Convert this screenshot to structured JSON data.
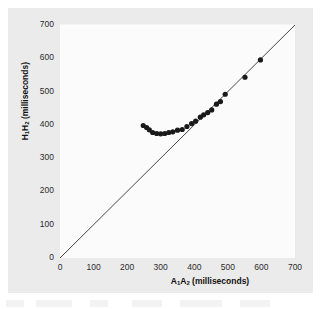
{
  "chart_data": {
    "type": "scatter",
    "title": "",
    "xlabel": "A1A2 (milliseconds)",
    "ylabel": "H1H2 (milliseconds)",
    "xlabel_parts": {
      "prefix": "A",
      "sub1": "1",
      "mid": "A",
      "sub2": "2",
      "suffix": " (milliseconds)"
    },
    "ylabel_parts": {
      "prefix": "H",
      "sub1": "1",
      "mid": "H",
      "sub2": "2",
      "suffix": " (milliseconds)"
    },
    "xlim": [
      0,
      700
    ],
    "ylim": [
      0,
      700
    ],
    "xticks": [
      0,
      100,
      200,
      300,
      400,
      500,
      600,
      700
    ],
    "yticks": [
      0,
      100,
      200,
      300,
      400,
      500,
      600,
      700
    ],
    "grid": false,
    "legend": "none",
    "marker": {
      "shape": "circle",
      "color": "#1a1a1a",
      "size_px": 5.2
    },
    "reference_line": {
      "name": "identity-line",
      "description": "line of identity, slope 1",
      "x": [
        0,
        700
      ],
      "y": [
        0,
        700
      ],
      "color": "#333333",
      "width_px": 0.9
    },
    "points": [
      {
        "x": 248,
        "y": 398
      },
      {
        "x": 258,
        "y": 392
      },
      {
        "x": 266,
        "y": 385
      },
      {
        "x": 276,
        "y": 377
      },
      {
        "x": 288,
        "y": 374
      },
      {
        "x": 300,
        "y": 373
      },
      {
        "x": 312,
        "y": 374
      },
      {
        "x": 324,
        "y": 377
      },
      {
        "x": 336,
        "y": 379
      },
      {
        "x": 350,
        "y": 384
      },
      {
        "x": 364,
        "y": 386
      },
      {
        "x": 378,
        "y": 395
      },
      {
        "x": 392,
        "y": 404
      },
      {
        "x": 404,
        "y": 411
      },
      {
        "x": 418,
        "y": 423
      },
      {
        "x": 428,
        "y": 430
      },
      {
        "x": 440,
        "y": 437
      },
      {
        "x": 452,
        "y": 445
      },
      {
        "x": 466,
        "y": 462
      },
      {
        "x": 478,
        "y": 470
      },
      {
        "x": 492,
        "y": 492
      },
      {
        "x": 551,
        "y": 543
      },
      {
        "x": 597,
        "y": 595
      }
    ],
    "n_points": 23,
    "colors": {
      "marker": "#1a1a1a",
      "line": "#333333",
      "panel_background": "#ebebeb",
      "plot_background": "#fbfbfb",
      "text": "#2b2b2b"
    }
  }
}
